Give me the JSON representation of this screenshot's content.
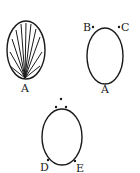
{
  "diagram": {
    "figures": [
      {
        "id": "fig1",
        "description": "oval with fan of lines converging at bottom point",
        "labels": [
          {
            "text": "A",
            "position": "bottom"
          }
        ]
      },
      {
        "id": "fig2",
        "description": "oval with points marked at top-left, top-right and bottom",
        "labels": [
          {
            "text": "B",
            "position": "top-left"
          },
          {
            "text": "C",
            "position": "top-right"
          },
          {
            "text": "A",
            "position": "bottom"
          }
        ]
      },
      {
        "id": "fig3",
        "description": "oval with three dots above and points at lower-left and lower-right",
        "labels": [
          {
            "text": "D",
            "position": "bottom-left"
          },
          {
            "text": "E",
            "position": "bottom-right"
          }
        ]
      }
    ],
    "colors": {
      "stroke": "#1a1a1a",
      "background": "#ffffff"
    }
  }
}
